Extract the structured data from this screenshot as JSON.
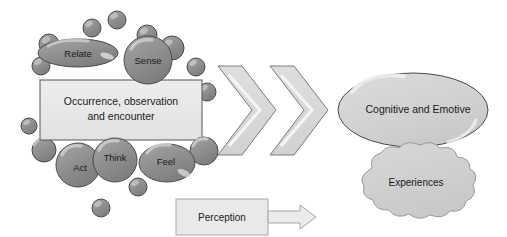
{
  "diagram": {
    "colors": {
      "bubble_fill": "#8d8d8d",
      "bubble_stroke": "#4a4a4a",
      "bubble_highlight": "#d6d6d6",
      "box_fill": "#e9e9e9",
      "box_stroke": "#555555",
      "oval_fill": "#d3d3d3",
      "oval_stroke": "#4a4a4a",
      "cloud_fill": "#d0d0d0",
      "cloud_stroke": "#9a9a9a",
      "chevron_fill": "#d9d9d9",
      "chevron_stroke": "#7a7a7a",
      "chevron_highlight": "#f2f2f2",
      "arrow_fill": "#ebebeb",
      "arrow_stroke": "#a5a5a5",
      "text": "#1a1a1a",
      "background": "#ffffff"
    },
    "stimulus_box": {
      "label_line1": "Occurrence, observation",
      "label_line2": "and encounter"
    },
    "sense_bubbles": [
      {
        "id": "relate",
        "label": "Relate",
        "cx": 78,
        "cy": 53,
        "rx": 40,
        "ry": 14
      },
      {
        "id": "sense",
        "label": "Sense",
        "cx": 148,
        "cy": 60,
        "rx": 24,
        "ry": 24
      },
      {
        "id": "act",
        "label": "Act",
        "cx": 78,
        "cy": 165,
        "rx": 22,
        "ry": 22
      },
      {
        "id": "think",
        "label": "Think",
        "cx": 115,
        "cy": 160,
        "rx": 22,
        "ry": 22
      },
      {
        "id": "feel",
        "label": "Feel",
        "cx": 167,
        "cy": 163,
        "rx": 28,
        "ry": 19
      }
    ],
    "decor_bubbles": [
      {
        "cx": 92,
        "cy": 28,
        "r": 9
      },
      {
        "cx": 117,
        "cy": 20,
        "r": 9
      },
      {
        "cx": 147,
        "cy": 35,
        "r": 10
      },
      {
        "cx": 172,
        "cy": 48,
        "r": 12
      },
      {
        "cx": 49,
        "cy": 44,
        "r": 10
      },
      {
        "cx": 41,
        "cy": 66,
        "r": 9
      },
      {
        "cx": 196,
        "cy": 67,
        "r": 9
      },
      {
        "cx": 207,
        "cy": 92,
        "r": 9
      },
      {
        "cx": 29,
        "cy": 126,
        "r": 8
      },
      {
        "cx": 44,
        "cy": 150,
        "r": 12
      },
      {
        "cx": 204,
        "cy": 151,
        "r": 14
      },
      {
        "cx": 138,
        "cy": 187,
        "r": 9
      },
      {
        "cx": 101,
        "cy": 208,
        "r": 9
      }
    ],
    "chevrons": [
      {
        "id": "chevron-1",
        "x": 218
      },
      {
        "id": "chevron-2",
        "x": 270
      }
    ],
    "outcome_oval": {
      "label": "Cognitive and Emotive",
      "cx": 413,
      "cy": 110,
      "rx": 75,
      "ry": 37
    },
    "experiences_cloud": {
      "label": "Experiences",
      "cx": 415,
      "cy": 188
    },
    "perception": {
      "label": "Perception",
      "arrow_name": "perception-flow-arrow"
    }
  }
}
